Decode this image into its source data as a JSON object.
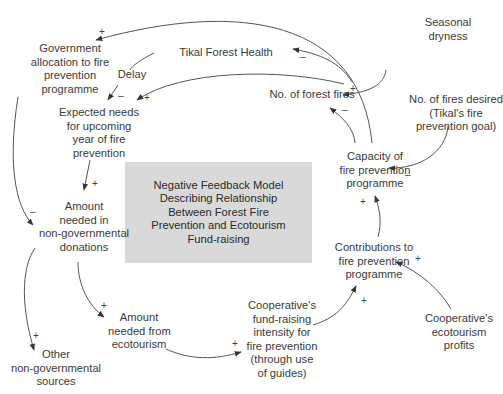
{
  "diagram": {
    "title_lines": [
      "Negative Feedback Model",
      "Describing Relationship",
      "Between Forest Fire",
      "Prevention and Ecotourism",
      "Fund-raising"
    ],
    "colors": {
      "box_fill": "#d9d9d9",
      "text": "#3a3a3a",
      "arrow": "#333333"
    },
    "nodes": {
      "government_allocation": {
        "lines": [
          "Government",
          "allocation to fire",
          "prevention",
          "programme"
        ]
      },
      "tikal_forest_health": {
        "lines": [
          "Tikal Forest Health"
        ]
      },
      "delay": {
        "lines": [
          "Delay"
        ]
      },
      "seasonal_dryness": {
        "lines": [
          "Seasonal",
          "dryness"
        ]
      },
      "no_forest_fires": {
        "lines": [
          "No. of forest fires"
        ]
      },
      "expected_needs": {
        "lines": [
          "Expected needs",
          "for upcoming",
          "year of fire",
          "prevention"
        ]
      },
      "fires_desired": {
        "lines": [
          "No. of fires desired",
          "(Tikal's fire",
          "prevention goal)"
        ]
      },
      "capacity": {
        "lines": [
          "Capacity of",
          "fire prevention",
          "programme"
        ]
      },
      "amount_non_gov": {
        "lines": [
          "Amount",
          "needed in",
          "non-governmental",
          "donations"
        ]
      },
      "contributions": {
        "lines": [
          "Contributions to",
          "fire prevention",
          "programme"
        ]
      },
      "amount_ecotourism": {
        "lines": [
          "Amount",
          "needed from",
          "ecotourism"
        ]
      },
      "coop_fundraising": {
        "lines": [
          "Cooperative's",
          "fund-raising",
          "intensity for",
          "fire prevention",
          "(through use",
          "of guides)"
        ]
      },
      "coop_profits": {
        "lines": [
          "Cooperative's",
          "ecotourism",
          "profits"
        ]
      },
      "other_sources": {
        "lines": [
          "Other",
          "non-governmental",
          "sources"
        ]
      }
    },
    "polarities": {
      "fires_to_government": "+",
      "fires_to_health": "–",
      "health_to_expected": "–",
      "fires_to_expected": "+",
      "dryness_to_fires": "+",
      "capacity_to_fires": "–",
      "desired_to_capacity": "–",
      "expected_to_amount": "+",
      "government_to_amount": "–",
      "contributions_to_capacity": "+",
      "profits_to_contributions": "+",
      "coop_to_contributions": "+",
      "amount_to_ecotourism": "+",
      "ecotourism_to_coop": "+",
      "amount_to_other": "+"
    }
  }
}
